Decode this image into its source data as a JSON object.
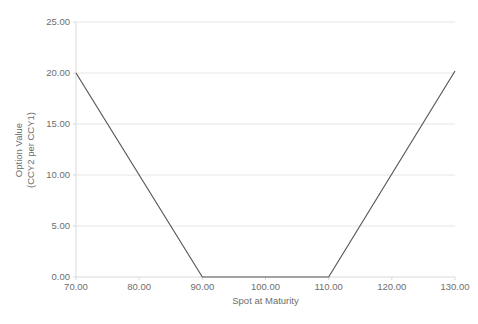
{
  "chart_data": {
    "type": "line",
    "title": "",
    "xlabel": "Spot at Maturity",
    "ylabel": "Option Value (CCY2 per CCY1)",
    "ylabel_line1": "Option Value",
    "ylabel_line2": "(CCY2 per CCY1)",
    "xlim": [
      70,
      130
    ],
    "ylim": [
      0,
      25
    ],
    "xticks": [
      70,
      80,
      90,
      100,
      110,
      120,
      130
    ],
    "xtick_labels": [
      "70.00",
      "80.00",
      "90.00",
      "100.00",
      "110.00",
      "120.00",
      "130.00"
    ],
    "yticks": [
      0,
      5,
      10,
      15,
      20,
      25
    ],
    "ytick_labels": [
      "0.00",
      "5.00",
      "10.00",
      "15.00",
      "20.00",
      "25.00"
    ],
    "grid": "horizontal",
    "legend": "none",
    "series": [
      {
        "name": "Option Value",
        "color": "#595959",
        "x": [
          70,
          90,
          110,
          130
        ],
        "values": [
          20.0,
          0.0,
          0.0,
          20.2
        ]
      }
    ]
  },
  "axis": {
    "x_title": "Spot at Maturity",
    "y_title_line1": "Option Value",
    "y_title_line2": "(CCY2 per CCY1)"
  },
  "caption": {
    "cut_off_text": ""
  },
  "colors": {
    "series_line": "#595959",
    "gridline": "#e6e6e6",
    "axis_line": "#d9d9d9",
    "tick_text": "#6e6e6e",
    "background": "#ffffff"
  }
}
